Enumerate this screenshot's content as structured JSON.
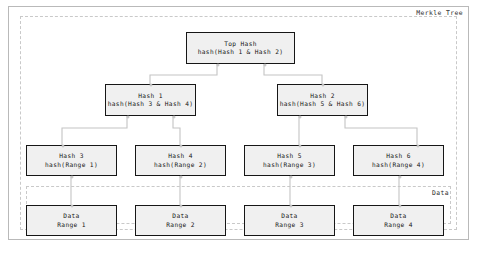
{
  "diagram": {
    "title_label": "Merkle Tree",
    "data_group_label": "Data",
    "colors": {
      "node_fill": "#f0f0f0",
      "node_border": "#161616",
      "cluster_border": "#c9c9c9",
      "frame_border": "#b9b9b9",
      "wire": "#c4c4c4",
      "text": "#161616"
    },
    "nodes": {
      "top": {
        "line1": "Top Hash",
        "line2": "hash(Hash 1 & Hash 2)"
      },
      "h1": {
        "line1": "Hash 1",
        "line2": "hash(Hash 3 & Hash 4)"
      },
      "h2": {
        "line1": "Hash 2",
        "line2": "hash(Hash 5 & Hash 6)"
      },
      "h3": {
        "line1": "Hash 3",
        "line2": "hash(Range 1)"
      },
      "h4": {
        "line1": "Hash 4",
        "line2": "hash(Range 2)"
      },
      "h5": {
        "line1": "Hash 5",
        "line2": "hash(Range 3)"
      },
      "h6": {
        "line1": "Hash 6",
        "line2": "hash(Range 4)"
      },
      "d1": {
        "line1": "Data",
        "line2": "Range 1"
      },
      "d2": {
        "line1": "Data",
        "line2": "Range 2"
      },
      "d3": {
        "line1": "Data",
        "line2": "Range 3"
      },
      "d4": {
        "line1": "Data",
        "line2": "Range 4"
      }
    }
  }
}
